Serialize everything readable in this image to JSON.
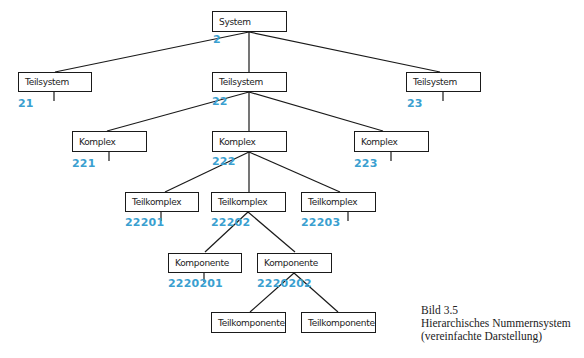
{
  "diagram": {
    "nodes": [
      {
        "id": "system",
        "label": "System",
        "number": "2"
      },
      {
        "id": "teilsystem-21",
        "label": "Teilsystem",
        "number": "21"
      },
      {
        "id": "teilsystem-22",
        "label": "Teilsystem",
        "number": "22"
      },
      {
        "id": "teilsystem-23",
        "label": "Teilsystem",
        "number": "23"
      },
      {
        "id": "komplex-221",
        "label": "Komplex",
        "number": "221"
      },
      {
        "id": "komplex-222",
        "label": "Komplex",
        "number": "222"
      },
      {
        "id": "komplex-223",
        "label": "Komplex",
        "number": "223"
      },
      {
        "id": "teilkomplex-22201",
        "label": "Teilkomplex",
        "number": "22201"
      },
      {
        "id": "teilkomplex-22202",
        "label": "Teilkomplex",
        "number": "22202"
      },
      {
        "id": "teilkomplex-22203",
        "label": "Teilkomplex",
        "number": "22203"
      },
      {
        "id": "komponente-2220201",
        "label": "Komponente",
        "number": "2220201"
      },
      {
        "id": "komponente-2220202",
        "label": "Komponente",
        "number": "2220202"
      },
      {
        "id": "teilkomponente-1",
        "label": "Teilkomponente",
        "number": ""
      },
      {
        "id": "teilkomponente-2",
        "label": "Teilkomponente",
        "number": ""
      }
    ],
    "edges": [
      [
        "system",
        "teilsystem-21"
      ],
      [
        "system",
        "teilsystem-22"
      ],
      [
        "system",
        "teilsystem-23"
      ],
      [
        "teilsystem-22",
        "komplex-221"
      ],
      [
        "teilsystem-22",
        "komplex-222"
      ],
      [
        "teilsystem-22",
        "komplex-223"
      ],
      [
        "komplex-222",
        "teilkomplex-22201"
      ],
      [
        "komplex-222",
        "teilkomplex-22202"
      ],
      [
        "komplex-222",
        "teilkomplex-22203"
      ],
      [
        "teilkomplex-22202",
        "komponente-2220201"
      ],
      [
        "teilkomplex-22202",
        "komponente-2220202"
      ],
      [
        "komponente-2220202",
        "teilkomponente-1"
      ],
      [
        "komponente-2220202",
        "teilkomponente-2"
      ]
    ],
    "number_color": "#3a9fd0"
  },
  "caption": {
    "figure": "Bild 3.5",
    "title": "Hierarchisches Nummernsystem",
    "subtitle": "(vereinfachte Darstellung)"
  }
}
